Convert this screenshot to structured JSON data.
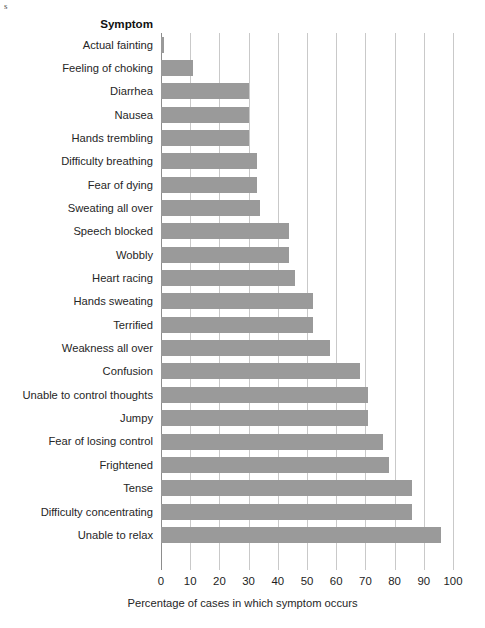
{
  "artifact": {
    "text": "s"
  },
  "chart_data": {
    "type": "bar",
    "orientation": "horizontal",
    "title": "",
    "xlabel": "Percentage of cases in which symptom occurs",
    "ylabel": "Symptom",
    "xlim": [
      0,
      100
    ],
    "xticks": [
      0,
      10,
      20,
      30,
      40,
      50,
      60,
      70,
      80,
      90,
      100
    ],
    "grid": "vertical",
    "legend": "none",
    "bar_color": "#9a9a9a",
    "gridline_color": "#c9c9c9",
    "axis_color": "#8d8d8d",
    "categories": [
      "Actual fainting",
      "Feeling of choking",
      "Diarrhea",
      "Nausea",
      "Hands trembling",
      "Difficulty breathing",
      "Fear of dying",
      "Sweating all over",
      "Speech blocked",
      "Wobbly",
      "Heart racing",
      "Hands sweating",
      "Terrified",
      "Weakness all over",
      "Confusion",
      "Unable to control thoughts",
      "Jumpy",
      "Fear of losing control",
      "Frightened",
      "Tense",
      "Difficulty concentrating",
      "Unable to relax"
    ],
    "values": [
      1,
      11,
      30,
      30,
      30,
      33,
      33,
      34,
      44,
      44,
      46,
      52,
      52,
      58,
      68,
      71,
      71,
      76,
      78,
      86,
      86,
      96
    ]
  }
}
